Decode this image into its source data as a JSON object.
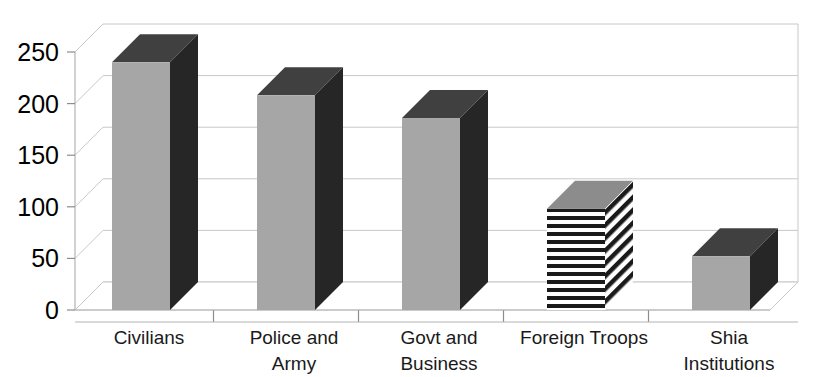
{
  "chart_data": {
    "type": "bar",
    "title": "",
    "subtitle": "",
    "xlabel": "",
    "ylabel": "",
    "categories": [
      "Civilians",
      "Police and Army",
      "Govt and Business",
      "Foreign Troops",
      "Shia Institutions"
    ],
    "values": [
      240,
      208,
      186,
      98,
      52
    ],
    "ylim": [
      0,
      250
    ],
    "ytick_labels": [
      "0",
      "50",
      "100",
      "150",
      "200",
      "250"
    ],
    "ytick_values": [
      0,
      50,
      100,
      150,
      200,
      250
    ],
    "grid": true,
    "legend": "none",
    "style": "3d-column",
    "series": [
      {
        "name": "",
        "values": [
          240,
          208,
          186,
          98,
          52
        ]
      }
    ],
    "bar_fills": [
      "solid",
      "solid",
      "solid",
      "horizontal-stripes",
      "solid"
    ],
    "colors": {
      "bar_front": "#a6a6a6",
      "bar_side": "#262626",
      "bar_top": "#404040",
      "stripe_dark": "#1a1a1a",
      "stripe_light": "#ffffff",
      "gridline": "#c8c8c8",
      "axis": "#b4b4b4",
      "text": "#000000",
      "background": "#ffffff"
    }
  },
  "category_label_lines": [
    [
      "Civilians"
    ],
    [
      "Police and",
      "Army"
    ],
    [
      "Govt and",
      "Business"
    ],
    [
      "Foreign Troops"
    ],
    [
      "Shia",
      "Institutions"
    ]
  ]
}
